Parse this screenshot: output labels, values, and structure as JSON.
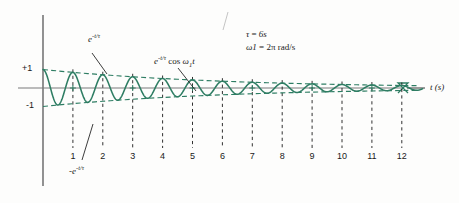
{
  "figure": {
    "title": "",
    "axis": {
      "x_label": "t (s)",
      "y_positive_label": "+1",
      "y_negative_label": "-1",
      "x_ticks": [
        "1",
        "2",
        "3",
        "4",
        "5",
        "6",
        "7",
        "8",
        "9",
        "10",
        "11",
        "12"
      ]
    },
    "annotations": {
      "envelope_upper": {
        "base": "e",
        "exponent": "-t/τ"
      },
      "envelope_lower": {
        "prefix": "-",
        "base": "e",
        "exponent": "-t/τ"
      },
      "waveform": {
        "base": "e",
        "exponent": "-t/τ",
        "factor": "cos",
        "omega": "ω",
        "omega_sub": "1",
        "omega_var": "t"
      }
    },
    "parameters": [
      {
        "symbol": "τ",
        "equals": "=",
        "value": "6s"
      },
      {
        "symbol": "ω",
        "sub": "1",
        "equals": "=",
        "value": "2π rad/s"
      }
    ],
    "colors": {
      "curve": "#2e7d63",
      "envelope": "#2e7d63",
      "axis": "#4a4a4a",
      "text": "#1a1a1a",
      "background": "#fdfdfc"
    }
  },
  "chart_data": {
    "type": "line",
    "title": "",
    "xlabel": "t (s)",
    "ylabel": "",
    "xlim": [
      0,
      12.7
    ],
    "ylim": [
      -1.15,
      1.15
    ],
    "grid": false,
    "legend": "none",
    "tau": 6,
    "omega1_rad_per_s": 6.283185307179586,
    "xticks": [
      1,
      2,
      3,
      4,
      5,
      6,
      7,
      8,
      9,
      10,
      11,
      12
    ],
    "yticks": [
      -1,
      1
    ],
    "ytick_labels": [
      "-1",
      "+1"
    ],
    "series": [
      {
        "name": "e^{-t/tau} cos(omega_1 t)",
        "kind": "damped-cosine",
        "style": "solid",
        "color": "#2e7d63",
        "formula": "exp(-t/6)*cos(2*pi*t)"
      },
      {
        "name": "e^{-t/tau}",
        "kind": "envelope-upper",
        "style": "dashed",
        "color": "#2e7d63",
        "formula": "exp(-t/6)"
      },
      {
        "name": "-e^{-t/tau}",
        "kind": "envelope-lower",
        "style": "dashed",
        "color": "#2e7d63",
        "formula": "-exp(-t/6)"
      }
    ],
    "annotations": [
      {
        "text": "e^{-t/τ}",
        "target": "upper envelope"
      },
      {
        "text": "e^{-t/τ} cos ω₁t",
        "target": "damped cosine curve"
      },
      {
        "text": "-e^{-t/τ}",
        "target": "lower envelope"
      },
      {
        "text": "τ = 6s"
      },
      {
        "text": "ω₁ = 2π rad/s"
      }
    ]
  }
}
